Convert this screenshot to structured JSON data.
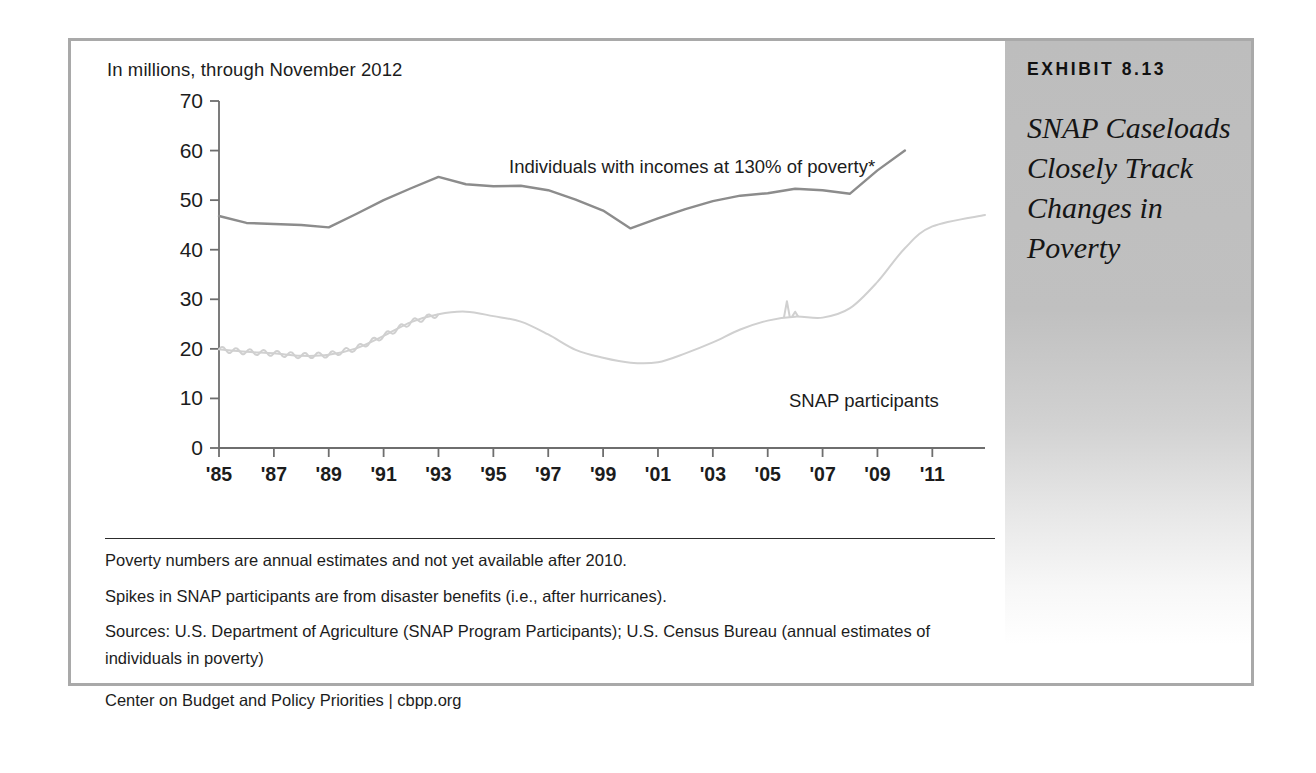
{
  "exhibit": {
    "label": "EXHIBIT 8.13",
    "title": "SNAP Caseloads Closely Track Changes in Poverty"
  },
  "notes": {
    "poverty_note": "Poverty numbers are annual estimates and not yet available after 2010.",
    "spikes_note": "Spikes in SNAP participants are from disaster benefits (i.e., after hurricanes).",
    "sources": "Sources: U.S. Department of Agriculture (SNAP Program Participants); U.S. Census Bureau (annual estimates of individuals in poverty)",
    "credit": "Center on Budget and Policy Priorities | cbpp.org"
  },
  "chart_data": {
    "type": "line",
    "title": "",
    "subtitle": "In millions, through November 2012",
    "xlabel": "",
    "ylabel": "",
    "ylim": [
      0,
      70
    ],
    "xlim": [
      1985,
      2012.92
    ],
    "yticks": [
      "0",
      "10",
      "20",
      "30",
      "40",
      "50",
      "60",
      "70"
    ],
    "ytick_values": [
      0,
      10,
      20,
      30,
      40,
      50,
      60,
      70
    ],
    "xticks": [
      "'85",
      "'87",
      "'89",
      "'91",
      "'93",
      "'95",
      "'97",
      "'99",
      "'01",
      "'03",
      "'05",
      "'07",
      "'09",
      "'11"
    ],
    "xtick_values": [
      1985,
      1987,
      1989,
      1991,
      1993,
      1995,
      1997,
      1999,
      2001,
      2003,
      2005,
      2007,
      2009,
      2011
    ],
    "grid": false,
    "legend_position": "inline-annotations",
    "colors": {
      "poverty_line": "#8c8c8c",
      "snap_line": "#d0d0d0",
      "axis": "#6e6e6e",
      "text": "#1c1c1c",
      "sidebar": "#bdbdbd",
      "frame": "#a9a9a9"
    },
    "series": [
      {
        "name": "Individuals with incomes at 130% of poverty*",
        "label": "Individuals with incomes at 130% of poverty*",
        "color": "#8c8c8c",
        "x": [
          1985,
          1986,
          1987,
          1988,
          1989,
          1990,
          1991,
          1992,
          1993,
          1994,
          1995,
          1996,
          1997,
          1998,
          1999,
          2000,
          2001,
          2002,
          2003,
          2004,
          2005,
          2006,
          2007,
          2008,
          2009,
          2010
        ],
        "values": [
          46.8,
          45.4,
          45.2,
          45.0,
          44.5,
          47.2,
          50.0,
          52.4,
          54.7,
          53.2,
          52.8,
          52.9,
          52.0,
          50.1,
          47.9,
          44.3,
          46.3,
          48.2,
          49.8,
          50.9,
          51.4,
          52.3,
          52.0,
          51.3,
          56.0,
          60.0
        ]
      },
      {
        "name": "SNAP participants",
        "label": "SNAP participants",
        "color": "#d0d0d0",
        "x": [
          1985,
          1986,
          1987,
          1988,
          1989,
          1990,
          1991,
          1992,
          1993,
          1994,
          1995,
          1996,
          1997,
          1998,
          1999,
          2000,
          2001,
          2002,
          2003,
          2004,
          2005,
          2006,
          2007,
          2008,
          2009,
          2010,
          2011,
          2012.92
        ],
        "values": [
          19.9,
          19.4,
          19.1,
          18.6,
          18.8,
          20.1,
          22.6,
          25.4,
          27.0,
          27.5,
          26.6,
          25.5,
          22.9,
          19.8,
          18.2,
          17.2,
          17.3,
          19.1,
          21.3,
          23.9,
          25.7,
          26.5,
          26.3,
          28.2,
          33.5,
          40.3,
          44.7,
          47.0
        ]
      }
    ],
    "annotations": [
      {
        "text": "Spike 2005 (hurricane disaster benefits)",
        "x": 2005.7,
        "y": 29.6
      },
      {
        "text": "Spike 2006 (hurricane disaster benefits)",
        "x": 2006.0,
        "y": 27.5
      }
    ]
  }
}
